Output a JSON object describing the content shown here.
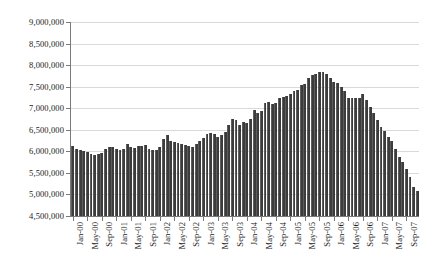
{
  "chart_data": {
    "type": "bar",
    "title": "",
    "subtitle": "",
    "xlabel": "",
    "ylabel": "",
    "grid": true,
    "legend": "none",
    "ylim": [
      4500000,
      9000000
    ],
    "ytick_values": [
      4500000,
      5000000,
      5500000,
      6000000,
      6500000,
      7000000,
      7500000,
      8000000,
      8500000,
      9000000
    ],
    "ytick_labels": [
      "4,500,000",
      "5,000,000",
      "5,500,000",
      "6,000,000",
      "6,500,000",
      "7,000,000",
      "7,500,000",
      "8,000,000",
      "8,500,000",
      "9,000,000"
    ],
    "xtick_labels": [
      "Jan-00",
      "May-00",
      "Sep-00",
      "Jan-01",
      "May-01",
      "Sep-01",
      "Jan-02",
      "May-02",
      "Sep-02",
      "Jan-03",
      "May-03",
      "Sep-03",
      "Jan-04",
      "May-04",
      "Sep-04",
      "Jan-05",
      "May-05",
      "Sep-05",
      "Jan-06",
      "May-06",
      "Sep-06",
      "Jan-07",
      "May-07",
      "Sep-07"
    ],
    "xtick_interval": 4,
    "bar_color": "#3c3c3c",
    "gridline_color": "#d9d9d9",
    "axis_color": "#7a7a7a",
    "categories": [
      "Jan-00",
      "Feb-00",
      "Mar-00",
      "Apr-00",
      "May-00",
      "Jun-00",
      "Jul-00",
      "Aug-00",
      "Sep-00",
      "Oct-00",
      "Nov-00",
      "Dec-00",
      "Jan-01",
      "Feb-01",
      "Mar-01",
      "Apr-01",
      "May-01",
      "Jun-01",
      "Jul-01",
      "Aug-01",
      "Sep-01",
      "Oct-01",
      "Nov-01",
      "Dec-01",
      "Jan-02",
      "Feb-02",
      "Mar-02",
      "Apr-02",
      "May-02",
      "Jun-02",
      "Jul-02",
      "Aug-02",
      "Sep-02",
      "Oct-02",
      "Nov-02",
      "Dec-02",
      "Jan-03",
      "Feb-03",
      "Mar-03",
      "Apr-03",
      "May-03",
      "Jun-03",
      "Jul-03",
      "Aug-03",
      "Sep-03",
      "Oct-03",
      "Nov-03",
      "Dec-03",
      "Jan-04",
      "Feb-04",
      "Mar-04",
      "Apr-04",
      "May-04",
      "Jun-04",
      "Jul-04",
      "Aug-04",
      "Sep-04",
      "Oct-04",
      "Nov-04",
      "Dec-04",
      "Jan-05",
      "Feb-05",
      "Mar-05",
      "Apr-05",
      "May-05",
      "Jun-05",
      "Jul-05",
      "Aug-05",
      "Sep-05",
      "Oct-05",
      "Nov-05",
      "Dec-05",
      "Jan-06",
      "Feb-06",
      "Mar-06",
      "Apr-06",
      "May-06",
      "Jun-06",
      "Jul-06",
      "Aug-06",
      "Sep-06",
      "Oct-06",
      "Nov-06",
      "Dec-06",
      "Jan-07",
      "Feb-07",
      "Mar-07",
      "Apr-07",
      "May-07",
      "Jun-07",
      "Jul-07",
      "Aug-07",
      "Sep-07",
      "Oct-07",
      "Nov-07",
      "Dec-07"
    ],
    "values": [
      6120000,
      6050000,
      6020000,
      6000000,
      5990000,
      5940000,
      5910000,
      5940000,
      5970000,
      6060000,
      6090000,
      6110000,
      6060000,
      6040000,
      6060000,
      6180000,
      6110000,
      6080000,
      6120000,
      6130000,
      6140000,
      6060000,
      6030000,
      6040000,
      6110000,
      6290000,
      6370000,
      6230000,
      6210000,
      6200000,
      6160000,
      6150000,
      6130000,
      6110000,
      6170000,
      6250000,
      6310000,
      6400000,
      6420000,
      6400000,
      6340000,
      6380000,
      6450000,
      6620000,
      6750000,
      6720000,
      6600000,
      6680000,
      6660000,
      6750000,
      6960000,
      6900000,
      6930000,
      7120000,
      7150000,
      7100000,
      7110000,
      7230000,
      7260000,
      7280000,
      7320000,
      7400000,
      7430000,
      7530000,
      7560000,
      7700000,
      7760000,
      7790000,
      7850000,
      7830000,
      7790000,
      7700000,
      7620000,
      7580000,
      7500000,
      7400000,
      7240000,
      7240000,
      7230000,
      7240000,
      7330000,
      7190000,
      7030000,
      6880000,
      6730000,
      6560000,
      6470000,
      6330000,
      6240000,
      6060000,
      5860000,
      5760000,
      5600000,
      5400000,
      5180000,
      5080000
    ]
  }
}
